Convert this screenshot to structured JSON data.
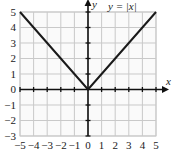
{
  "chart_data": {
    "type": "line",
    "title": "",
    "subtitle": "",
    "equation_label": "y = |x|",
    "xlabel": "x",
    "ylabel": "y",
    "xlim": [
      -5,
      5
    ],
    "ylim": [
      -3,
      5
    ],
    "grid": true,
    "grid_step": 1,
    "legend_position": "top-right-inside",
    "axes_style": "arrowed-cartesian",
    "xticks": [
      -5,
      -4,
      -3,
      -2,
      -1,
      0,
      1,
      2,
      3,
      4,
      5
    ],
    "xtick_labels": [
      "−5",
      "−4",
      "−3",
      "−2",
      "−1",
      "0",
      "1",
      "2",
      "3",
      "4",
      "5"
    ],
    "yticks": [
      -3,
      -2,
      -1,
      0,
      1,
      2,
      3,
      4,
      5
    ],
    "ytick_labels": [
      "−3",
      "−2",
      "−1",
      "0",
      "1",
      "2",
      "3",
      "4",
      "5"
    ],
    "series": [
      {
        "name": "y = |x|",
        "color": "#1a1a1a",
        "linewidth": 2,
        "x": [
          -5,
          -4,
          -3,
          -2,
          -1,
          0,
          1,
          2,
          3,
          4,
          5
        ],
        "values": [
          5,
          4,
          3,
          2,
          1,
          0,
          1,
          2,
          3,
          4,
          5
        ]
      }
    ],
    "vertex": [
      0,
      0
    ],
    "colors": {
      "curve": "#1a1a1a",
      "axis": "#111111",
      "grid": "#c9c9c9",
      "background": "#fafafa",
      "text": "#1a1a1a"
    }
  },
  "figure": {
    "plot_area": {
      "left": 20,
      "top": 12,
      "right": 156,
      "bottom": 136
    }
  }
}
